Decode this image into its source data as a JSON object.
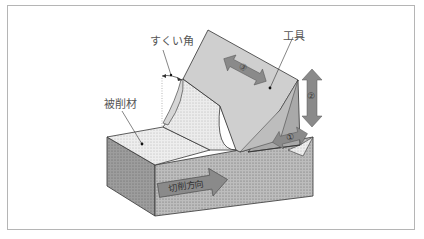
{
  "diagram": {
    "labels": {
      "rake_angle": "すくい角",
      "tool": "工具",
      "workpiece": "被削材",
      "cutting_direction": "切削方向"
    },
    "arrows": {
      "arrow_3": "③",
      "arrow_2": "②",
      "arrow_1": "①"
    },
    "colors": {
      "frame": "#b5b5b5",
      "tool_face": "#cfcfcf",
      "tool_side": "#a9a9a9",
      "workpiece_top": "#eeeeee",
      "workpiece_side": "#9d9d9d",
      "workpiece_front": "#bdbdbd",
      "chip": "#d6d6d6",
      "arrow_fill": "#8a8a8a",
      "outline": "#333333"
    }
  }
}
